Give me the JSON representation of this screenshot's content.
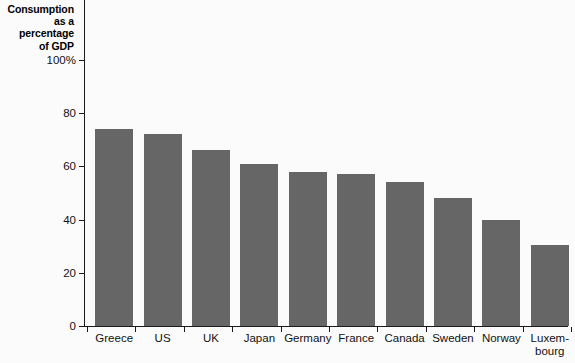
{
  "chart_data": {
    "type": "bar",
    "title": "",
    "subtitle": "",
    "ylabel": "Consumption as a percentage of GDP",
    "xlabel": "",
    "ylim": [
      0,
      100
    ],
    "yticks": [
      0,
      20,
      40,
      60,
      80,
      100
    ],
    "ytick_labels": [
      "0",
      "20",
      "40",
      "60",
      "80",
      "100%"
    ],
    "grid": false,
    "legend": false,
    "bar_color": "#666666",
    "axis_color": "#1a1a1a",
    "background_color": "#fbfbfb",
    "categories": [
      "Greece",
      "US",
      "UK",
      "Japan",
      "Germany",
      "France",
      "Canada",
      "Sweden",
      "Norway",
      "Luxem-bourg"
    ],
    "category_lines": [
      [
        "Greece"
      ],
      [
        "US"
      ],
      [
        "UK"
      ],
      [
        "Japan"
      ],
      [
        "Germany"
      ],
      [
        "France"
      ],
      [
        "Canada"
      ],
      [
        "Sweden"
      ],
      [
        "Norway"
      ],
      [
        "Luxem-",
        "bourg"
      ]
    ],
    "values": [
      74,
      72,
      66,
      61,
      58,
      57,
      54,
      48,
      40,
      30.5
    ]
  },
  "axis_title": {
    "line1": "Consumption",
    "line2": "as a",
    "line3": "percentage",
    "line4": "of GDP"
  }
}
